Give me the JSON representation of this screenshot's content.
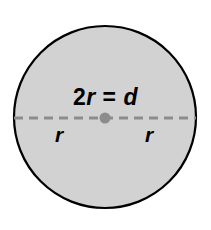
{
  "figure": {
    "name": "circle-radius-diameter-diagram",
    "background_color": "#ffffff",
    "circle": {
      "fill_color": "#d2d2d2",
      "stroke_color": "#000000",
      "stroke_width": 2,
      "center_x": 105,
      "center_y": 117,
      "radius": 92
    },
    "diameter_line": {
      "color": "#8c8c8c",
      "style": "dashed",
      "dash_length": 9,
      "gap_length": 6,
      "width": 3,
      "y": 118
    },
    "center_point": {
      "color": "#8c8c8c",
      "radius": 5
    },
    "labels": {
      "diameter_equation": {
        "coefficient": "2",
        "radius_symbol": "r",
        "equals": "=",
        "diameter_symbol": "d",
        "full_text": "2r = d"
      },
      "radius_left": "r",
      "radius_right": "r"
    }
  }
}
